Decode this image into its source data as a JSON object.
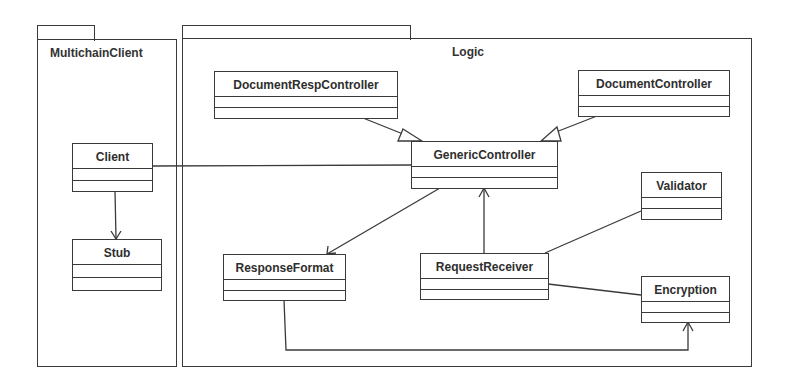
{
  "diagram": {
    "type": "UML class diagram",
    "packages": [
      {
        "id": "multichain",
        "name": "MultichainClient"
      },
      {
        "id": "logic",
        "name": "Logic"
      }
    ],
    "classes": {
      "client": {
        "name": "Client",
        "package": "MultichainClient"
      },
      "stub": {
        "name": "Stub",
        "package": "MultichainClient"
      },
      "document_resp_controller": {
        "name": "DocumentRespController",
        "package": "Logic"
      },
      "document_controller": {
        "name": "DocumentController",
        "package": "Logic"
      },
      "generic_controller": {
        "name": "GenericController",
        "package": "Logic"
      },
      "response_format": {
        "name": "ResponseFormat",
        "package": "Logic"
      },
      "request_receiver": {
        "name": "RequestReceiver",
        "package": "Logic"
      },
      "validator": {
        "name": "Validator",
        "package": "Logic"
      },
      "encryption": {
        "name": "Encryption",
        "package": "Logic"
      }
    },
    "relationships": [
      {
        "from": "DocumentRespController",
        "to": "GenericController",
        "type": "generalization"
      },
      {
        "from": "DocumentController",
        "to": "GenericController",
        "type": "generalization"
      },
      {
        "from": "Client",
        "to": "GenericController",
        "type": "association"
      },
      {
        "from": "Client",
        "to": "Stub",
        "type": "directed-association"
      },
      {
        "from": "GenericController",
        "to": "ResponseFormat",
        "type": "directed-association"
      },
      {
        "from": "RequestReceiver",
        "to": "GenericController",
        "type": "directed-association"
      },
      {
        "from": "RequestReceiver",
        "to": "Validator",
        "type": "association"
      },
      {
        "from": "RequestReceiver",
        "to": "Encryption",
        "type": "association"
      },
      {
        "from": "ResponseFormat",
        "to": "Encryption",
        "type": "directed-association"
      }
    ],
    "colors": {
      "line": "#3a3a3a",
      "text": "#2e2e2e",
      "background": "#ffffff"
    }
  }
}
